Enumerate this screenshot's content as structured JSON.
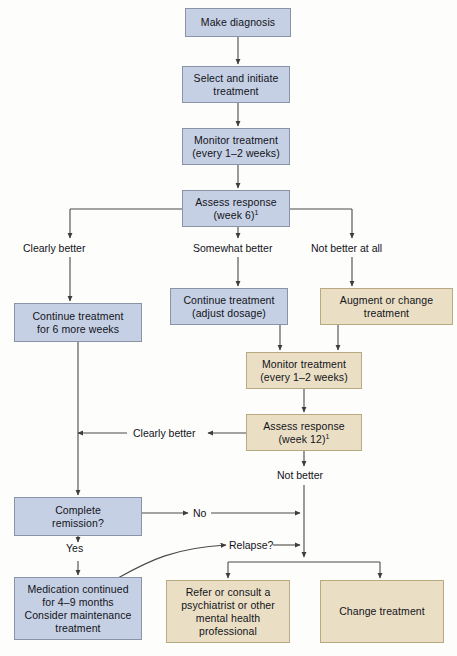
{
  "diagram": {
    "colors": {
      "blue_fill": "#c6d0e4",
      "blue_stroke": "#8b93a6",
      "tan_fill": "#eadfc5",
      "tan_stroke": "#b8a981",
      "line": "#4a4a4a",
      "text": "#12131a",
      "background": "#fdfdfb"
    },
    "nodes": [
      {
        "id": "make_diagnosis",
        "label": "Make diagnosis",
        "lines": [
          "Make diagnosis"
        ],
        "style": "blue",
        "x": 185,
        "y": 8,
        "w": 106,
        "h": 29
      },
      {
        "id": "select_initiate",
        "label": "Select and initiate treatment",
        "lines": [
          "Select and initiate",
          "treatment"
        ],
        "style": "blue",
        "x": 182,
        "y": 66,
        "w": 108,
        "h": 37
      },
      {
        "id": "monitor_1",
        "label": "Monitor treatment (every 1-2 weeks)",
        "lines": [
          "Monitor treatment",
          "(every 1–2 weeks)"
        ],
        "style": "blue",
        "x": 182,
        "y": 128,
        "w": 108,
        "h": 37
      },
      {
        "id": "assess_week6",
        "label": "Assess response (week 6)",
        "lines": [
          "Assess response",
          "(week 6)"
        ],
        "footnote": "1",
        "style": "blue",
        "x": 182,
        "y": 190,
        "w": 108,
        "h": 37
      },
      {
        "id": "continue_adjust",
        "label": "Continue treatment (adjust dosage)",
        "lines": [
          "Continue treatment",
          "(adjust dosage)"
        ],
        "style": "blue",
        "x": 170,
        "y": 288,
        "w": 118,
        "h": 37
      },
      {
        "id": "augment_change",
        "label": "Augment or change treatment",
        "lines": [
          "Augment or change",
          "treatment"
        ],
        "style": "tan",
        "x": 320,
        "y": 288,
        "w": 133,
        "h": 37
      },
      {
        "id": "continue_6weeks",
        "label": "Continue treatment for 6 more weeks",
        "lines": [
          "Continue treatment",
          "for 6 more weeks"
        ],
        "style": "blue",
        "x": 14,
        "y": 303,
        "w": 128,
        "h": 39
      },
      {
        "id": "monitor_2",
        "label": "Monitor treatment (every 1-2 weeks)",
        "lines": [
          "Monitor treatment",
          "(every 1–2 weeks)"
        ],
        "style": "tan",
        "x": 246,
        "y": 352,
        "w": 116,
        "h": 37
      },
      {
        "id": "assess_week12",
        "label": "Assess response (week 12)",
        "lines": [
          "Assess response",
          "(week 12)"
        ],
        "footnote": "1",
        "style": "tan",
        "x": 246,
        "y": 414,
        "w": 116,
        "h": 37
      },
      {
        "id": "complete_remission",
        "label": "Complete remission?",
        "lines": [
          "Complete",
          "remission?"
        ],
        "style": "blue",
        "x": 14,
        "y": 497,
        "w": 128,
        "h": 39
      },
      {
        "id": "medication_continued",
        "label": "Medication continued for 4-9 months Consider maintenance treatment",
        "lines": [
          "Medication continued",
          "for 4–9 months",
          "Consider maintenance",
          "treatment"
        ],
        "style": "blue",
        "x": 14,
        "y": 577,
        "w": 128,
        "h": 63
      },
      {
        "id": "refer_consult",
        "label": "Refer or consult a psychiatrist or other mental health professional",
        "lines": [
          "Refer or consult a",
          "psychiatrist or other",
          "mental health",
          "professional"
        ],
        "style": "tan",
        "x": 166,
        "y": 580,
        "w": 124,
        "h": 63
      },
      {
        "id": "change_treatment",
        "label": "Change treatment",
        "lines": [
          "Change treatment"
        ],
        "style": "tan",
        "x": 320,
        "y": 580,
        "w": 124,
        "h": 63
      }
    ],
    "edge_labels": [
      {
        "id": "clearly_better_top",
        "text": "Clearly better",
        "x": 44,
        "y": 248
      },
      {
        "id": "somewhat_better",
        "text": "Somewhat better",
        "x": 192,
        "y": 248
      },
      {
        "id": "not_better_at_all",
        "text": "Not better at all",
        "x": 330,
        "y": 248
      },
      {
        "id": "clearly_better_mid",
        "text": "Clearly better",
        "x": 137,
        "y": 425
      },
      {
        "id": "not_better",
        "text": "Not better",
        "x": 278,
        "y": 475
      },
      {
        "id": "yes",
        "text": "Yes",
        "x": 65,
        "y": 552
      },
      {
        "id": "no",
        "text": "No",
        "x": 195,
        "y": 507
      },
      {
        "id": "relapse",
        "text": "Relapse?",
        "x": 232,
        "y": 539
      }
    ]
  }
}
